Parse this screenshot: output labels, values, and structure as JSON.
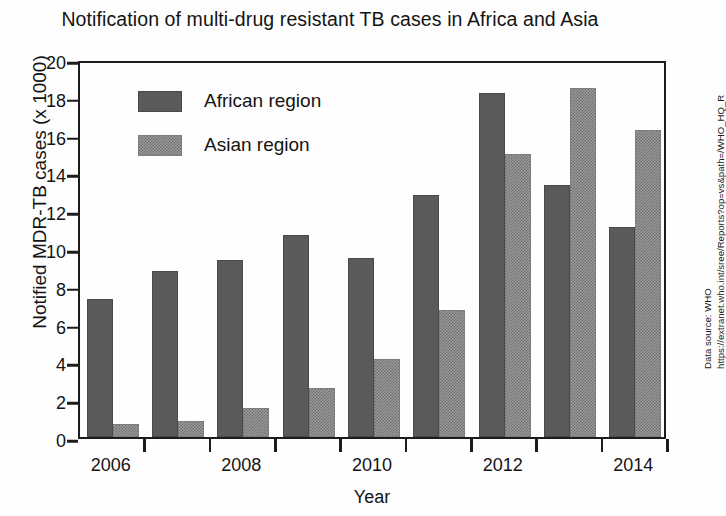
{
  "chart_data": {
    "type": "bar",
    "title": "Notification of multi-drug resistant TB cases in Africa and Asia",
    "xlabel": "Year",
    "ylabel": "Notified MDR-TB cases (x 1000)",
    "ylim": [
      0,
      20
    ],
    "ytick_step": 2,
    "yticks": [
      0,
      2,
      4,
      6,
      8,
      10,
      12,
      14,
      16,
      18,
      20
    ],
    "grid": false,
    "legend_position": "upper-left-inside",
    "categories": [
      "2006",
      "2007",
      "2008",
      "2009",
      "2010",
      "2011",
      "2012",
      "2013",
      "2014"
    ],
    "xtick_labels_shown": [
      "2006",
      "",
      "2008",
      "",
      "2010",
      "",
      "2012",
      "",
      "2014"
    ],
    "series": [
      {
        "name": "African region",
        "color": "#5a5a5a",
        "pattern": "solid",
        "values": [
          7.3,
          8.8,
          9.35,
          10.7,
          9.45,
          12.8,
          18.2,
          13.35,
          11.1
        ]
      },
      {
        "name": "Asian region",
        "color": "#9a9a9a",
        "pattern": "dotted",
        "values": [
          0.7,
          0.85,
          1.55,
          2.6,
          4.15,
          6.7,
          15.0,
          18.45,
          16.25
        ]
      }
    ],
    "annotations": [
      "Data source: WHO",
      "https://extranet.who.int/sree/Reports?op=vs&path=/WHO_HQ_R",
      "eports/G2/PROD/EXT/MDRTB_Indicators_charts"
    ]
  }
}
